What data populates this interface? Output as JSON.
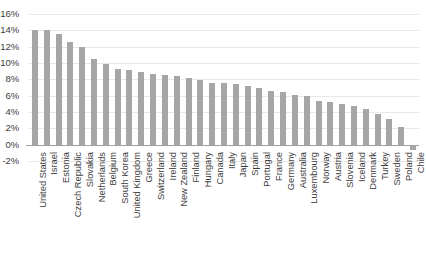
{
  "chart_data": {
    "type": "bar",
    "title": "",
    "subtitle": "",
    "xlabel": "",
    "ylabel": "",
    "ylim": [
      -2,
      16
    ],
    "ytick_labels": [
      "16%",
      "14%",
      "12%",
      "10%",
      "8%",
      "6%",
      "4%",
      "2%",
      "0%",
      "-2%"
    ],
    "ytick_values": [
      16,
      14,
      12,
      10,
      8,
      6,
      4,
      2,
      0,
      -2
    ],
    "grid": true,
    "legend": false,
    "legend_position": "none",
    "bar_color": "#a6a6a6",
    "gridline_color": "#e8e8e8",
    "axis_color": "#a0a0a0",
    "categories": [
      "United States",
      "Israel",
      "Estonia",
      "Czech Republic",
      "Slovakia",
      "Netherlands",
      "Belgium",
      "South Korea",
      "United Kingdom",
      "Greece",
      "Switzerland",
      "Ireland",
      "New Zealand",
      "Finland",
      "Hungary",
      "Canada",
      "Italy",
      "Japan",
      "Spain",
      "Portugal",
      "France",
      "Germany",
      "Australia",
      "Luxembourg",
      "Norway",
      "Austria",
      "Slovenia",
      "Iceland",
      "Denmark",
      "Turkey",
      "Sweden",
      "Poland",
      "Chile"
    ],
    "values": [
      14.1,
      14.0,
      13.6,
      12.6,
      11.9,
      10.5,
      9.9,
      9.3,
      9.1,
      8.9,
      8.7,
      8.5,
      8.4,
      8.2,
      7.9,
      7.6,
      7.5,
      7.4,
      7.2,
      6.9,
      6.6,
      6.4,
      6.1,
      5.9,
      5.4,
      5.2,
      5.0,
      4.7,
      4.4,
      3.7,
      3.1,
      2.2,
      -0.6
    ]
  }
}
